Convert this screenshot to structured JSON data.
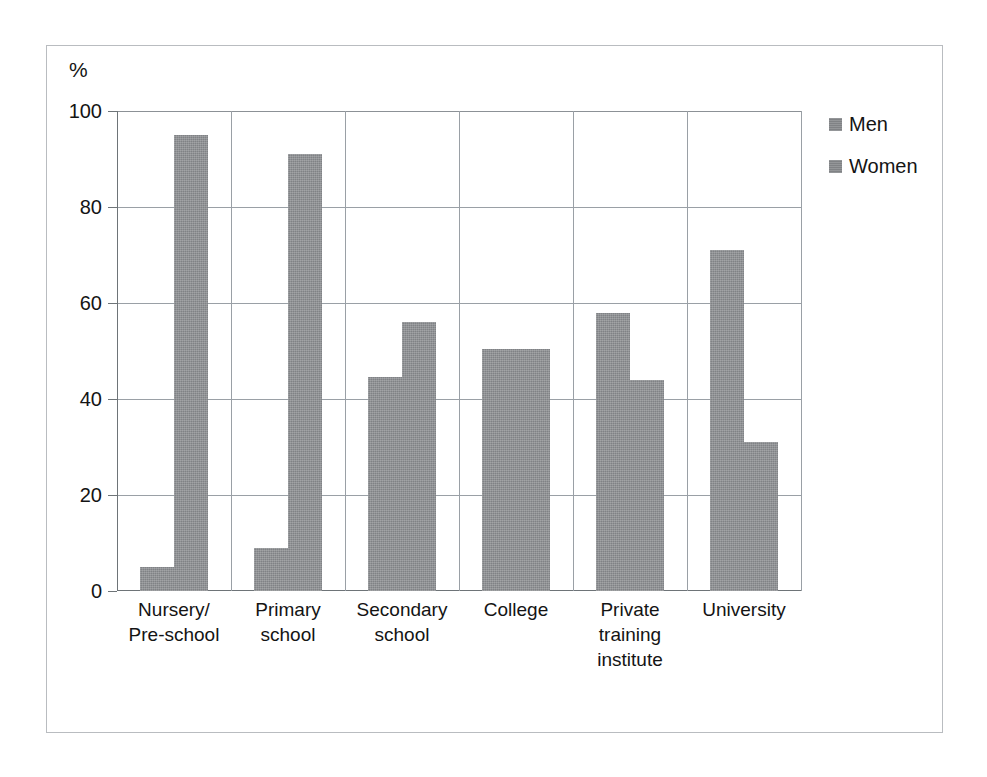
{
  "chart_data": {
    "type": "bar",
    "title": "",
    "subtitle": "",
    "xlabel": "",
    "ylabel": "%",
    "ylim": [
      0,
      100
    ],
    "yticks": [
      0,
      20,
      40,
      60,
      80,
      100
    ],
    "ytick_labels": [
      "0",
      "20",
      "40",
      "60",
      "80",
      "100"
    ],
    "grid": "horizontal-and-category-separators",
    "legend_position": "right",
    "categories": [
      "Nursery/\nPre-school",
      "Primary\nschool",
      "Secondary\nschool",
      "College",
      "Private\ntraining\ninstitute",
      "University"
    ],
    "category_lines": [
      [
        "Nursery/",
        "Pre-school"
      ],
      [
        "Primary",
        "school"
      ],
      [
        "Secondary",
        "school"
      ],
      [
        "College"
      ],
      [
        "Private",
        "training",
        "institute"
      ],
      [
        "University"
      ]
    ],
    "series": [
      {
        "name": "Men",
        "color": "#808285",
        "values": [
          5,
          9,
          44.5,
          50.5,
          58,
          71
        ]
      },
      {
        "name": "Women",
        "color": "#808285",
        "values": [
          95,
          91,
          56,
          50.5,
          44,
          31
        ]
      }
    ]
  },
  "legend": {
    "entries": [
      {
        "label": "Men",
        "swatch": "legend-swatch-men"
      },
      {
        "label": "Women",
        "swatch": "legend-swatch-women"
      }
    ]
  },
  "axis": {
    "unit_label": "%"
  }
}
